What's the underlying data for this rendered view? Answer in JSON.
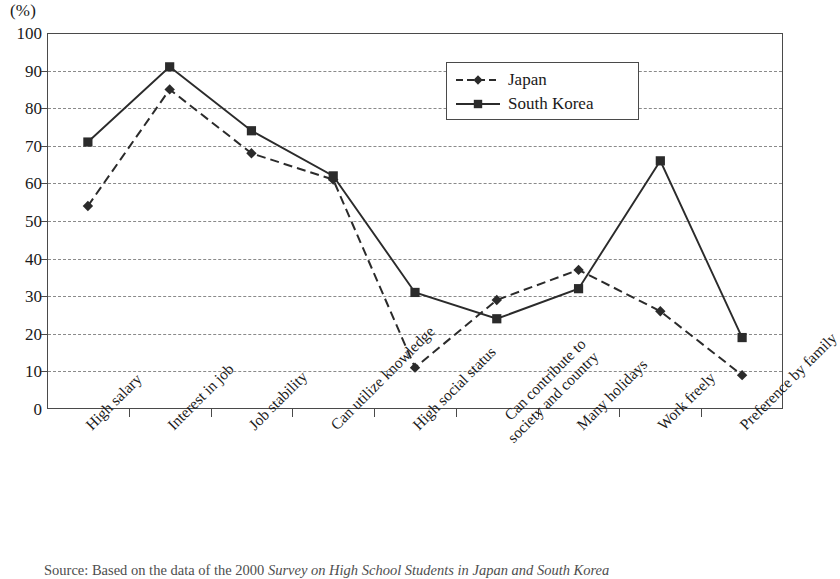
{
  "axis": {
    "unit_label": "(%)",
    "y_ticks": [
      0,
      10,
      20,
      30,
      40,
      50,
      60,
      70,
      80,
      90,
      100
    ]
  },
  "legend": {
    "position": "top-center-right",
    "entries": [
      {
        "label": "Japan",
        "marker": "diamond-marker",
        "line": "dashed",
        "color": "#2b2b2b"
      },
      {
        "label": "South Korea",
        "marker": "square-marker",
        "line": "solid",
        "color": "#2b2b2b"
      }
    ]
  },
  "source": {
    "label": "Source: ",
    "prefix": "Based on the data of the 2000 ",
    "title": "Survey on High School Students in Japan and South Korea"
  },
  "chart_data": {
    "type": "line",
    "title": "",
    "subtitle": "",
    "xlabel": "",
    "ylabel": "",
    "yunit": "(%)",
    "ylim": [
      0,
      100
    ],
    "ytick_step": 10,
    "grid": true,
    "grid_style": "dashed-horizontal",
    "legend_position": "top-center-right",
    "categories": [
      "High salary",
      "Interest in job",
      "Job stability",
      "Can utilize knowledge",
      "High social status",
      "Can contribute to\nsociety and country",
      "Many holidays",
      "Work freely",
      "Preference by family"
    ],
    "series": [
      {
        "name": "Japan",
        "style": "dashed",
        "marker": "diamond",
        "color": "#2b2b2b",
        "values": [
          54,
          85,
          68,
          61,
          11,
          29,
          37,
          26,
          9
        ]
      },
      {
        "name": "South Korea",
        "style": "solid",
        "marker": "square",
        "color": "#2b2b2b",
        "values": [
          71,
          91,
          74,
          62,
          31,
          24,
          32,
          66,
          19
        ]
      }
    ]
  }
}
